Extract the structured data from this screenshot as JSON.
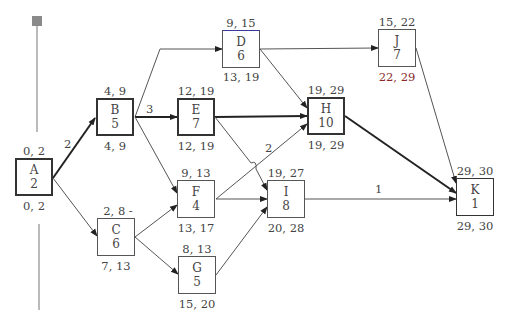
{
  "diagram": {
    "type": "activity-on-node network (critical path)",
    "nodes": [
      {
        "id": "A",
        "duration": "2",
        "top": "0, 2",
        "bottom": "0, 2",
        "critical": true
      },
      {
        "id": "B",
        "duration": "5",
        "top": "4, 9",
        "bottom": "4, 9",
        "critical": true
      },
      {
        "id": "C",
        "duration": "6",
        "top": "2, 8 -",
        "bottom": "7, 13",
        "critical": false
      },
      {
        "id": "D",
        "duration": "6",
        "top": "9, 15",
        "bottom": "13, 19",
        "critical": false
      },
      {
        "id": "E",
        "duration": "7",
        "top": "12, 19",
        "bottom": "12, 19",
        "critical": true
      },
      {
        "id": "F",
        "duration": "4",
        "top": "9, 13",
        "bottom": "13, 17",
        "critical": false
      },
      {
        "id": "G",
        "duration": "5",
        "top": "8, 13",
        "bottom": "15, 20",
        "critical": false
      },
      {
        "id": "H",
        "duration": "10",
        "top": "19, 29",
        "bottom": "19, 29",
        "critical": true
      },
      {
        "id": "I",
        "duration": "8",
        "top": "19, 27",
        "bottom": "20, 28",
        "critical": false
      },
      {
        "id": "J",
        "duration": "7",
        "top": "15, 22",
        "bottom": "22, 29",
        "critical": false
      },
      {
        "id": "K",
        "duration": "1",
        "top": "29, 30",
        "bottom": "29, 30",
        "critical": true
      }
    ],
    "edges": [
      {
        "from": "A",
        "to": "B",
        "label": "2",
        "critical": true
      },
      {
        "from": "A",
        "to": "C",
        "label": "",
        "critical": false
      },
      {
        "from": "B",
        "to": "D",
        "label": "",
        "critical": false
      },
      {
        "from": "B",
        "to": "E",
        "label": "3",
        "critical": true
      },
      {
        "from": "B",
        "to": "F",
        "label": "",
        "critical": false
      },
      {
        "from": "C",
        "to": "F",
        "label": "",
        "critical": false
      },
      {
        "from": "C",
        "to": "G",
        "label": "",
        "critical": false
      },
      {
        "from": "D",
        "to": "J",
        "label": "",
        "critical": false
      },
      {
        "from": "D",
        "to": "H",
        "label": "",
        "critical": false
      },
      {
        "from": "E",
        "to": "H",
        "label": "",
        "critical": true
      },
      {
        "from": "E",
        "to": "I",
        "label": "",
        "critical": false
      },
      {
        "from": "F",
        "to": "H",
        "label": "2",
        "critical": false
      },
      {
        "from": "F",
        "to": "I",
        "label": "",
        "critical": false
      },
      {
        "from": "G",
        "to": "I",
        "label": "",
        "critical": false
      },
      {
        "from": "H",
        "to": "K",
        "label": "",
        "critical": true
      },
      {
        "from": "I",
        "to": "K",
        "label": "1",
        "critical": false
      },
      {
        "from": "J",
        "to": "K",
        "label": "",
        "critical": false
      }
    ]
  },
  "colors": {
    "line": "#555555",
    "critical_line": "#222222",
    "text": "#444444",
    "accent_red": "#8a2a2a",
    "marker": "#8a8a8a"
  }
}
